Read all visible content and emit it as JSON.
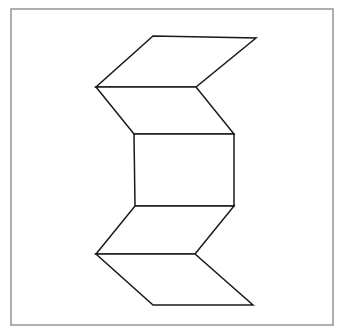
{
  "image": {
    "title": "Folded ribbon / zigzag prism line drawing",
    "width": 342,
    "height": 332,
    "background_color": "#ffffff",
    "description": "A black line drawing of a folded strip of paper (zigzag ribbon) shown inside a thin grey rectangular frame."
  },
  "frame": {
    "name": "outer-border",
    "x": 11,
    "y": 9,
    "width": 322,
    "height": 316,
    "stroke_color": "#8d8d8d",
    "stroke_width": 1.4,
    "fill_color": "#ffffff"
  },
  "figure": {
    "name": "folded-ribbon",
    "stroke_color": "#1a1a1a",
    "stroke_width": 1.5,
    "fill_color": "#ffffff",
    "faces": [
      {
        "name": "upper-flap",
        "label": "Top fold panel",
        "points": "153,36 256,38 196,87 96,87"
      },
      {
        "name": "upper-slant-panel",
        "label": "Upper slanted panel",
        "points": "96,87 196,87 234,134 134,134"
      },
      {
        "name": "center-rectangle",
        "label": "Central rectangular face",
        "points": "134,134 234,134 234,206 135,206"
      },
      {
        "name": "lower-slant-panel",
        "label": "Lower slanted panel",
        "points": "135,206 234,206 195,254 96,254"
      },
      {
        "name": "lower-flap",
        "label": "Bottom fold panel",
        "points": "96,254 195,254 253,305 153,305"
      }
    ],
    "vertices": [
      {
        "name": "top-left-apex",
        "x": 153,
        "y": 36
      },
      {
        "name": "top-right-apex",
        "x": 256,
        "y": 38
      },
      {
        "name": "left-notch-upper",
        "x": 96,
        "y": 87
      },
      {
        "name": "right-notch-upper",
        "x": 196,
        "y": 87
      },
      {
        "name": "rect-top-left",
        "x": 134,
        "y": 134
      },
      {
        "name": "rect-top-right",
        "x": 234,
        "y": 134
      },
      {
        "name": "rect-bottom-left",
        "x": 135,
        "y": 206
      },
      {
        "name": "rect-bottom-right",
        "x": 234,
        "y": 206
      },
      {
        "name": "left-notch-lower",
        "x": 96,
        "y": 254
      },
      {
        "name": "right-notch-lower",
        "x": 195,
        "y": 254
      },
      {
        "name": "bottom-left-apex",
        "x": 153,
        "y": 305
      },
      {
        "name": "bottom-right-apex",
        "x": 253,
        "y": 305
      }
    ]
  }
}
